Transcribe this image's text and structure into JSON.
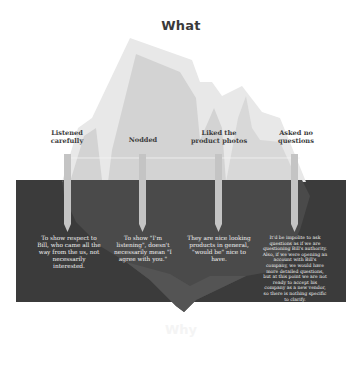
{
  "diagram": {
    "type": "iceberg",
    "title_top": "What",
    "title_bottom": "Why",
    "colors": {
      "water": "#3b3b3b",
      "ice_light": "#e6e6e6",
      "ice_mid": "#d2d2d2",
      "ice_underwater": "#4a4a4a",
      "pillar": "#c4c4c4",
      "text_above": "#3d3d3d",
      "text_below": "#f2f2f2"
    },
    "behaviors": [
      {
        "what": "Listened\ncarefully",
        "why": "To show respect to Bill, who came all the way from the us, not necessarily interested."
      },
      {
        "what": "Nodded",
        "why": "To show \"I'm listening\", doesn't necessarily mean \"I agree with you.\""
      },
      {
        "what": "Liked the\nproduct photos",
        "why": "They are nice looking products in general, \"would be\" nice to have."
      },
      {
        "what": "Asked no\nquestions",
        "why": "It'd be impolite to ask questions as if we are questioning Bill's authority. Also, if we were opening an account with Bill's company, we would have more detailed questions, but at this point we are not ready to accept his company as a new vendor, so there is nothing specific to clarify."
      }
    ]
  }
}
